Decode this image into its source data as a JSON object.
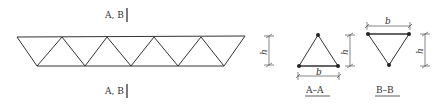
{
  "figure": {
    "section_mark_label": "A, B",
    "dimension_height_label": "h",
    "dimension_width_label": "b",
    "sections": [
      {
        "id": "A-A",
        "label": "A–A",
        "orientation": "apex-up"
      },
      {
        "id": "B-B",
        "label": "B–B",
        "orientation": "apex-down"
      }
    ],
    "truss": {
      "panels_top": 5,
      "panels_bottom": 4,
      "description": "triangular truss elevation with diagonal web members"
    }
  }
}
